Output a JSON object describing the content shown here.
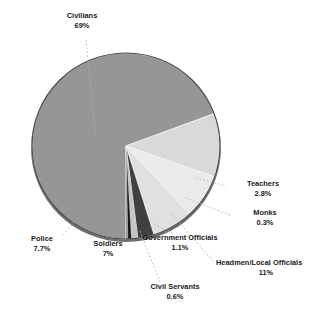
{
  "chart_data": {
    "type": "pie",
    "title": "",
    "subtitle": "",
    "xlabel": "",
    "ylabel": "",
    "legend_position": "none",
    "grid": false,
    "labels_outside": true,
    "categories": [
      "Civilians",
      "Headmen/Local Officials",
      "Police",
      "Soldiers",
      "Teachers",
      "Government Officials",
      "Civil Servants",
      "Monks"
    ],
    "values": [
      69,
      11,
      7.7,
      7,
      2.8,
      1.1,
      0.6,
      0.3
    ],
    "value_labels": [
      "69%",
      "11%",
      "7.7%",
      "7%",
      "2.8%",
      "1.1%",
      "0.6%",
      "0.3%"
    ],
    "colors": [
      "#969696",
      "#d9d9d9",
      "#ebebeb",
      "#e0e0e0",
      "#404040",
      "#c4c4c4",
      "#151515",
      "#8f8f8f"
    ],
    "slices": [
      {
        "name": "Civilians",
        "value": 69,
        "value_label": "69%",
        "color": "#969696"
      },
      {
        "name": "Headmen/Local Officials",
        "value": 11,
        "value_label": "11%",
        "color": "#d9d9d9"
      },
      {
        "name": "Police",
        "value": 7.7,
        "value_label": "7.7%",
        "color": "#ebebeb"
      },
      {
        "name": "Soldiers",
        "value": 7,
        "value_label": "7%",
        "color": "#e0e0e0"
      },
      {
        "name": "Teachers",
        "value": 2.8,
        "value_label": "2.8%",
        "color": "#404040"
      },
      {
        "name": "Government Officials",
        "value": 1.1,
        "value_label": "1.1%",
        "color": "#c4c4c4"
      },
      {
        "name": "Civil Servants",
        "value": 0.6,
        "value_label": "0.6%",
        "color": "#151515"
      },
      {
        "name": "Monks",
        "value": 0.3,
        "value_label": "0.3%",
        "color": "#8f8f8f"
      }
    ]
  },
  "labels": {
    "civilians": {
      "name": "Civilians",
      "pct": "69%"
    },
    "teachers": {
      "name": "Teachers",
      "pct": "2.8%"
    },
    "monks": {
      "name": "Monks",
      "pct": "0.3%"
    },
    "headmen": {
      "name": "Headmen/Local Officials",
      "pct": "11%"
    },
    "government": {
      "name": "Government Officials",
      "pct": "1.1%"
    },
    "civil_servants": {
      "name": "Civil Servants",
      "pct": "0.6%"
    },
    "soldiers": {
      "name": "Soldiers",
      "pct": "7%"
    },
    "police": {
      "name": "Police",
      "pct": "7.7%"
    }
  },
  "style": {
    "background": "#ffffff",
    "text_color": "#1a1a1a",
    "leader_color": "#a8a8a8",
    "pie_edge_color": "#3a3a3a"
  }
}
